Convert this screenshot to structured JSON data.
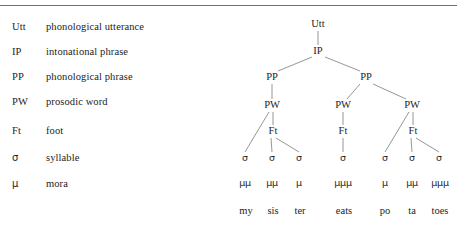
{
  "figure": {
    "rule_color": "#6f6f6f",
    "line_color": "#8a8a8a",
    "text_color": "#1d1d1d"
  },
  "legend": {
    "rows": [
      {
        "abbr": "Utt",
        "gloss": "phonological utterance",
        "y": 26
      },
      {
        "abbr": "IP",
        "gloss": "intonational phrase",
        "y": 51
      },
      {
        "abbr": "PP",
        "gloss": "phonological phrase",
        "y": 76
      },
      {
        "abbr": "PW",
        "gloss": "prosodic word",
        "y": 101
      },
      {
        "abbr": "Ft",
        "gloss": "foot",
        "y": 130
      },
      {
        "abbr": "σ",
        "gloss": "syllable",
        "y": 157
      },
      {
        "abbr": "μ",
        "gloss": "mora",
        "y": 183
      }
    ]
  },
  "tree": {
    "nodes": [
      {
        "id": "utt",
        "label": "Utt",
        "x": 318,
        "y": 24,
        "kind": "cat"
      },
      {
        "id": "ip",
        "label": "IP",
        "x": 318,
        "y": 51,
        "kind": "cat"
      },
      {
        "id": "pp1",
        "label": "PP",
        "x": 272,
        "y": 77,
        "kind": "cat"
      },
      {
        "id": "pp2",
        "label": "PP",
        "x": 366,
        "y": 77,
        "kind": "cat"
      },
      {
        "id": "pw1",
        "label": "PW",
        "x": 272,
        "y": 105,
        "kind": "cat"
      },
      {
        "id": "pw2",
        "label": "PW",
        "x": 343,
        "y": 105,
        "kind": "cat"
      },
      {
        "id": "pw3",
        "label": "PW",
        "x": 412,
        "y": 105,
        "kind": "cat"
      },
      {
        "id": "ft1",
        "label": "Ft",
        "x": 273,
        "y": 131,
        "kind": "cat"
      },
      {
        "id": "ft2",
        "label": "Ft",
        "x": 343,
        "y": 131,
        "kind": "cat"
      },
      {
        "id": "ft3",
        "label": "Ft",
        "x": 413,
        "y": 131,
        "kind": "cat"
      },
      {
        "id": "s1",
        "label": "σ",
        "x": 245,
        "y": 158,
        "kind": "sigma"
      },
      {
        "id": "s2",
        "label": "σ",
        "x": 272,
        "y": 158,
        "kind": "sigma"
      },
      {
        "id": "s3",
        "label": "σ",
        "x": 299,
        "y": 158,
        "kind": "sigma"
      },
      {
        "id": "s4",
        "label": "σ",
        "x": 343,
        "y": 158,
        "kind": "sigma"
      },
      {
        "id": "s5",
        "label": "σ",
        "x": 385,
        "y": 158,
        "kind": "sigma"
      },
      {
        "id": "s6",
        "label": "σ",
        "x": 412,
        "y": 158,
        "kind": "sigma"
      },
      {
        "id": "s7",
        "label": "σ",
        "x": 439,
        "y": 158,
        "kind": "sigma"
      },
      {
        "id": "m1",
        "label": "μμ",
        "x": 245,
        "y": 183,
        "kind": "mora"
      },
      {
        "id": "m2",
        "label": "μμ",
        "x": 272,
        "y": 183,
        "kind": "mora"
      },
      {
        "id": "m3",
        "label": "μ",
        "x": 299,
        "y": 183,
        "kind": "mora"
      },
      {
        "id": "m4",
        "label": "μμμ",
        "x": 343,
        "y": 183,
        "kind": "mora"
      },
      {
        "id": "m5",
        "label": "μ",
        "x": 385,
        "y": 183,
        "kind": "mora"
      },
      {
        "id": "m6",
        "label": "μμ",
        "x": 412,
        "y": 183,
        "kind": "mora"
      },
      {
        "id": "m7",
        "label": "μμμ",
        "x": 440,
        "y": 183,
        "kind": "mora"
      },
      {
        "id": "w1",
        "label": "my",
        "x": 246,
        "y": 211,
        "kind": "word"
      },
      {
        "id": "w2",
        "label": "sis",
        "x": 273,
        "y": 211,
        "kind": "word"
      },
      {
        "id": "w3",
        "label": "ter",
        "x": 300,
        "y": 211,
        "kind": "word"
      },
      {
        "id": "w4",
        "label": "eats",
        "x": 344,
        "y": 211,
        "kind": "word"
      },
      {
        "id": "w5",
        "label": "po",
        "x": 385,
        "y": 211,
        "kind": "word"
      },
      {
        "id": "w6",
        "label": "ta",
        "x": 412,
        "y": 211,
        "kind": "word"
      },
      {
        "id": "w7",
        "label": "toes",
        "x": 440,
        "y": 211,
        "kind": "word"
      }
    ],
    "edges": [
      {
        "from": "utt",
        "to": "ip",
        "x1": 318,
        "y1": 31,
        "x2": 318,
        "y2": 45
      },
      {
        "from": "ip",
        "to": "pp1",
        "x1": 312,
        "y1": 57,
        "x2": 278,
        "y2": 71
      },
      {
        "from": "ip",
        "to": "pp2",
        "x1": 325,
        "y1": 57,
        "x2": 360,
        "y2": 71
      },
      {
        "from": "pp1",
        "to": "pw1",
        "x1": 272,
        "y1": 84,
        "x2": 272,
        "y2": 99
      },
      {
        "from": "pp2",
        "to": "pw2",
        "x1": 360,
        "y1": 84,
        "x2": 347,
        "y2": 99
      },
      {
        "from": "pp2",
        "to": "pw3",
        "x1": 373,
        "y1": 84,
        "x2": 406,
        "y2": 99
      },
      {
        "from": "pw1",
        "to": "s1",
        "x1": 269,
        "y1": 112,
        "x2": 245,
        "y2": 152
      },
      {
        "from": "pw1",
        "to": "ft1",
        "x1": 273,
        "y1": 112,
        "x2": 273,
        "y2": 125
      },
      {
        "from": "pw2",
        "to": "ft2",
        "x1": 343,
        "y1": 112,
        "x2": 343,
        "y2": 125
      },
      {
        "from": "pw3",
        "to": "s5",
        "x1": 409,
        "y1": 112,
        "x2": 385,
        "y2": 152
      },
      {
        "from": "pw3",
        "to": "ft3",
        "x1": 413,
        "y1": 112,
        "x2": 413,
        "y2": 125
      },
      {
        "from": "ft1",
        "to": "s2",
        "x1": 271,
        "y1": 138,
        "x2": 272,
        "y2": 152
      },
      {
        "from": "ft1",
        "to": "s3",
        "x1": 276,
        "y1": 138,
        "x2": 299,
        "y2": 152
      },
      {
        "from": "ft2",
        "to": "s4",
        "x1": 343,
        "y1": 138,
        "x2": 343,
        "y2": 152
      },
      {
        "from": "ft3",
        "to": "s6",
        "x1": 411,
        "y1": 138,
        "x2": 412,
        "y2": 152
      },
      {
        "from": "ft3",
        "to": "s7",
        "x1": 416,
        "y1": 138,
        "x2": 439,
        "y2": 152
      }
    ]
  }
}
